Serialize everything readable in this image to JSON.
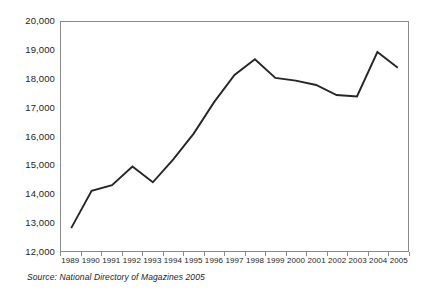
{
  "source_note": "Source: National Directory of Magazines 2005",
  "axis": {
    "y_tick_labels": [
      "20,000",
      "19,000",
      "18,000",
      "17,000",
      "16,000",
      "15,000",
      "14,000",
      "13,000",
      "12,000"
    ],
    "x_tick_labels": [
      "1989",
      "1990",
      "1991",
      "1992",
      "1993",
      "1994",
      "1995",
      "1996",
      "1997",
      "1998",
      "1999",
      "2000",
      "2001",
      "2002",
      "2003",
      "2004",
      "2005"
    ]
  },
  "style": {
    "line_color": "#262626",
    "frame_color": "#8a8a8a",
    "text_color": "#1d1d1d",
    "background": "#ffffff"
  },
  "chart_data": {
    "type": "line",
    "title": "",
    "subtitle": "",
    "xlabel": "",
    "ylabel": "",
    "xlim": [
      1989,
      2005
    ],
    "ylim": [
      12000,
      20000
    ],
    "y_ticks": [
      12000,
      13000,
      14000,
      15000,
      16000,
      17000,
      18000,
      19000,
      20000
    ],
    "grid": false,
    "legend": false,
    "annotations": [
      "Source: National Directory of Magazines 2005"
    ],
    "categories": [
      1989,
      1990,
      1991,
      1992,
      1993,
      1994,
      1995,
      1996,
      1997,
      1998,
      1999,
      2000,
      2001,
      2002,
      2003,
      2004,
      2005
    ],
    "values": [
      12800,
      14100,
      14300,
      14950,
      14400,
      15200,
      16100,
      17200,
      18150,
      18700,
      18050,
      17950,
      17800,
      17450,
      17400,
      18950,
      18400
    ]
  }
}
